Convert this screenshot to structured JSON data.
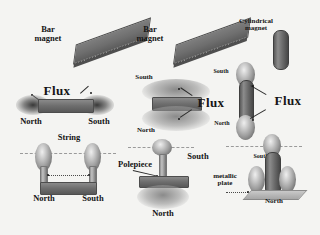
{
  "figure": {
    "background_color": "#f4f4f2",
    "ink_color": "#1a1a1a",
    "magnet_color": "#6e6e6e",
    "flux_color": "#8c8c8c"
  },
  "columns": [
    {
      "id": "bar-magnet-horizontal",
      "magnet_label": "Bar\nmagnet",
      "orientation": "horizontal",
      "rows": [
        {
          "id": "plain",
          "labels": []
        },
        {
          "id": "with-flux",
          "labels": [
            "Flux",
            "North",
            "South"
          ]
        },
        {
          "id": "suspended",
          "labels": [
            "String",
            "North",
            "South"
          ]
        }
      ]
    },
    {
      "id": "bar-magnet-vertical",
      "magnet_label": "Bar\nmagnet",
      "orientation": "vertical",
      "rows": [
        {
          "id": "plain",
          "labels": []
        },
        {
          "id": "with-flux",
          "labels": [
            "South",
            "Flux",
            "North"
          ]
        },
        {
          "id": "suspended",
          "labels": [
            "South",
            "Polepiece",
            "metallic plate",
            "North"
          ]
        }
      ]
    },
    {
      "id": "cylindrical-magnet",
      "magnet_label": "Cylindrical\nmagnet",
      "orientation": "vertical",
      "rows": [
        {
          "id": "plain",
          "labels": []
        },
        {
          "id": "with-flux",
          "labels": [
            "South",
            "Flux",
            "North"
          ]
        },
        {
          "id": "on-plate",
          "labels": [
            "South",
            "North"
          ]
        }
      ]
    }
  ],
  "labels": {
    "bar_magnet_line1": "Bar",
    "bar_magnet_line2": "magnet",
    "bar_magnet2_line1": "Bar",
    "bar_magnet2_line2": "magnet",
    "cylindrical_line1": "Cylindrical",
    "cylindrical_line2": "magnet",
    "flux_left": "Flux",
    "flux_mid": "Flux",
    "flux_right": "Flux",
    "north_l2": "North",
    "south_l2": "South",
    "string": "String",
    "north_l3": "North",
    "south_l3": "South",
    "south_m2": "South",
    "north_m2": "North",
    "south_m3": "South",
    "north_m3": "North",
    "polepiece": "Polepiece",
    "metallic_plate_line1": "metallic",
    "metallic_plate_line2": "plate",
    "south_r2": "South",
    "north_r2": "North",
    "south_r3": "South",
    "north_r3": "North"
  }
}
